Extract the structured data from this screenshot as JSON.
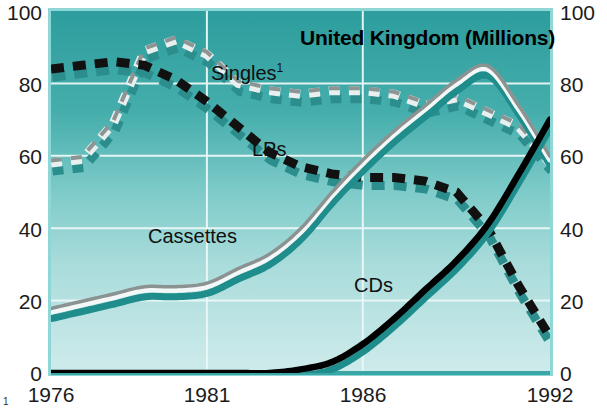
{
  "chart_data": {
    "type": "line",
    "title": "United Kingdom (Millions)",
    "xlabel": "",
    "ylabel": "",
    "ylim": [
      0,
      100
    ],
    "xlim": [
      1976,
      1992
    ],
    "grid": true,
    "legend": "inline-labels",
    "y_ticks": [
      "0",
      "20",
      "40",
      "60",
      "80",
      "100"
    ],
    "y_ticks_right": [
      "0",
      "20",
      "40",
      "60",
      "80",
      "100"
    ],
    "x_ticks": [
      "1976",
      "1981",
      "1986",
      "1992"
    ],
    "x_gridline_years": [
      1976,
      1981,
      1986,
      1992
    ],
    "footnote_mark": "1",
    "x": [
      1976,
      1977,
      1978,
      1979,
      1980,
      1981,
      1982,
      1983,
      1984,
      1985,
      1986,
      1987,
      1988,
      1989,
      1990,
      1991,
      1992
    ],
    "series": [
      {
        "name": "Singles",
        "label": "Singles",
        "label_superscript": "1",
        "style": "dashed",
        "color": "#e8ecec",
        "shadow_color": "#2e8f8f",
        "values": [
          58,
          59,
          69,
          89,
          92,
          88,
          80,
          78,
          77,
          78,
          78,
          77,
          74,
          76,
          72,
          68,
          58
        ]
      },
      {
        "name": "LPs",
        "label": "LPs",
        "style": "dashed",
        "color": "#101010",
        "shadow_color": "#2e8f8f",
        "values": [
          84,
          85,
          86,
          85,
          81,
          75,
          68,
          61,
          57,
          55,
          54,
          54,
          53,
          50,
          40,
          24,
          10
        ]
      },
      {
        "name": "Cassettes",
        "label": "Cassettes",
        "style": "solid",
        "color": "#9aa0a0",
        "highlight_color": "#f2f6f6",
        "shadow_color": "#1f8c8c",
        "values": [
          17,
          19,
          21,
          23,
          23,
          24,
          28,
          32,
          39,
          49,
          58,
          66,
          73,
          80,
          84,
          73,
          59
        ]
      },
      {
        "name": "CDs",
        "label": "CDs",
        "style": "solid",
        "color": "#000000",
        "shadow_color": "#1f8c8c",
        "values": [
          0,
          0,
          0,
          0,
          0,
          0,
          0,
          0,
          1,
          3,
          8,
          15,
          23,
          31,
          41,
          55,
          70
        ]
      }
    ],
    "colors": {
      "plot_bg_top": "#2e9d9d",
      "plot_bg_bottom": "#cce9ea",
      "gridline": "#eef7f7",
      "axis_text": "#1b1b1b",
      "title_text": "#000000",
      "plot_border": "#7fd0d0"
    }
  },
  "axis": {
    "left": {
      "t100": "100",
      "t80": "80",
      "t60": "60",
      "t40": "40",
      "t20": "20",
      "t0": "0"
    },
    "right": {
      "t100": "100",
      "t80": "80",
      "t60": "60",
      "t40": "40",
      "t20": "20",
      "t0": "0"
    },
    "x": {
      "x1976": "1976",
      "x1981": "1981",
      "x1986": "1986",
      "x1992": "1992"
    },
    "footnote_mark": "1"
  },
  "labels": {
    "title": "United Kingdom (Millions)",
    "singles": "Singles",
    "singles_sup": "1",
    "lps": "LPs",
    "cassettes": "Cassettes",
    "cds": "CDs"
  }
}
